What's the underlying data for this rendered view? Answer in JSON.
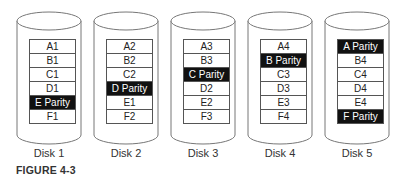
{
  "figure": {
    "caption": "FIGURE 4-3",
    "parity_color": "#111111",
    "data_color": "#ffffff"
  },
  "disks": [
    {
      "label": "Disk 1",
      "x": 16,
      "blocks": [
        {
          "text": "A1",
          "parity": false
        },
        {
          "text": "B1",
          "parity": false
        },
        {
          "text": "C1",
          "parity": false
        },
        {
          "text": "D1",
          "parity": false
        },
        {
          "text": "E Parity",
          "parity": true
        },
        {
          "text": "F1",
          "parity": false
        }
      ]
    },
    {
      "label": "Disk 2",
      "x": 93,
      "blocks": [
        {
          "text": "A2",
          "parity": false
        },
        {
          "text": "B2",
          "parity": false
        },
        {
          "text": "C2",
          "parity": false
        },
        {
          "text": "D Parity",
          "parity": true
        },
        {
          "text": "E1",
          "parity": false
        },
        {
          "text": "F2",
          "parity": false
        }
      ]
    },
    {
      "label": "Disk 3",
      "x": 170,
      "blocks": [
        {
          "text": "A3",
          "parity": false
        },
        {
          "text": "B3",
          "parity": false
        },
        {
          "text": "C Parity",
          "parity": true
        },
        {
          "text": "D2",
          "parity": false
        },
        {
          "text": "E2",
          "parity": false
        },
        {
          "text": "F3",
          "parity": false
        }
      ]
    },
    {
      "label": "Disk 4",
      "x": 247,
      "blocks": [
        {
          "text": "A4",
          "parity": false
        },
        {
          "text": "B Parity",
          "parity": true
        },
        {
          "text": "C3",
          "parity": false
        },
        {
          "text": "D3",
          "parity": false
        },
        {
          "text": "E3",
          "parity": false
        },
        {
          "text": "F4",
          "parity": false
        }
      ]
    },
    {
      "label": "Disk 5",
      "x": 324,
      "blocks": [
        {
          "text": "A Parity",
          "parity": true
        },
        {
          "text": "B4",
          "parity": false
        },
        {
          "text": "C4",
          "parity": false
        },
        {
          "text": "D4",
          "parity": false
        },
        {
          "text": "E4",
          "parity": false
        },
        {
          "text": "F Parity",
          "parity": true
        }
      ]
    }
  ]
}
